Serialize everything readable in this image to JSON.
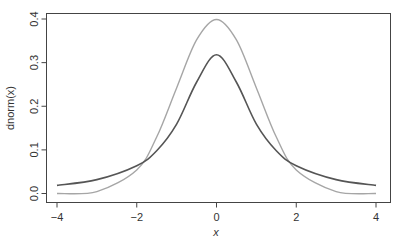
{
  "chart_data": {
    "type": "line",
    "title": "",
    "xlabel": "x",
    "ylabel": "dnorm(x)",
    "xlim": [
      -4,
      4
    ],
    "ylim": [
      0,
      0.4
    ],
    "x_ticks": [
      -4,
      -2,
      0,
      2,
      4
    ],
    "x_tick_labels": [
      "−4",
      "−2",
      "0",
      "2",
      "4"
    ],
    "y_ticks": [
      0.0,
      0.1,
      0.2,
      0.3,
      0.4
    ],
    "y_tick_labels": [
      "0.0",
      "0.1",
      "0.2",
      "0.3",
      "0.4"
    ],
    "grid": false,
    "legend": null,
    "series": [
      {
        "name": "normal density (light)",
        "color": "#a6a6a6",
        "x": [
          -4,
          -3,
          -2,
          -1.5,
          -1,
          -0.5,
          0,
          0.5,
          1,
          1.5,
          2,
          3,
          4
        ],
        "values": [
          0.0001,
          0.0044,
          0.054,
          0.1295,
          0.242,
          0.352,
          0.399,
          0.352,
          0.242,
          0.1295,
          0.054,
          0.0044,
          0.0001
        ]
      },
      {
        "name": "heavy-tailed density (dark)",
        "color": "#555555",
        "x": [
          -4,
          -3,
          -2,
          -1.5,
          -1,
          -0.5,
          0,
          0.5,
          1,
          1.5,
          2,
          3,
          4
        ],
        "values": [
          0.0187,
          0.0318,
          0.0637,
          0.098,
          0.159,
          0.255,
          0.318,
          0.255,
          0.159,
          0.098,
          0.0637,
          0.0318,
          0.0187
        ]
      }
    ]
  }
}
